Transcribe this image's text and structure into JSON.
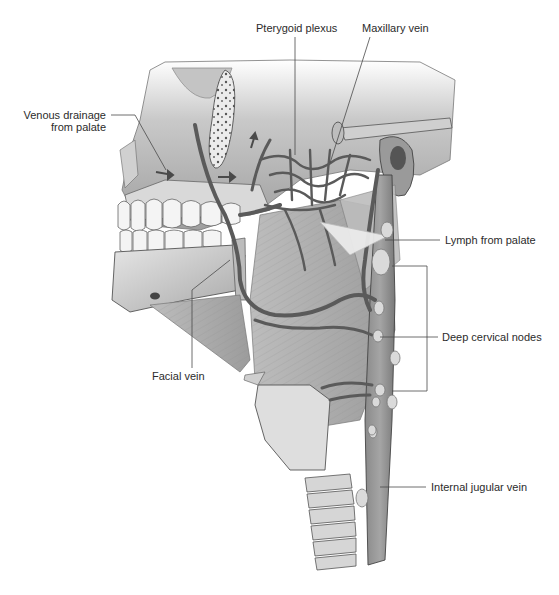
{
  "figure": {
    "colors": {
      "background": "#ffffff",
      "bone": "#d4d4d4",
      "bone_shadow": "#9a9a9a",
      "vein": "#6e6e6e",
      "vein_outline": "#3a3a3a",
      "muscle": "#b5b5b5",
      "node": "#dcdcdc",
      "label_text": "#2b2b2b",
      "leader_line": "#4a4a4a"
    },
    "labels": {
      "venous_drainage_line1": "Venous drainage",
      "venous_drainage_line2": "from palate",
      "pterygoid_plexus": "Pterygoid plexus",
      "maxillary_vein": "Maxillary vein",
      "lymph_from_palate": "Lymph from palate",
      "deep_cervical_nodes": "Deep cervical nodes",
      "facial_vein": "Facial vein",
      "internal_jugular_vein": "Internal jugular vein"
    }
  }
}
